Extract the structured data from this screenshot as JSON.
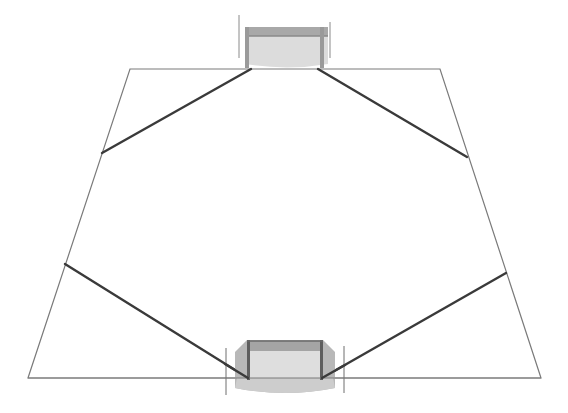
{
  "diagram": {
    "type": "football-pitch-perspective",
    "canvas": {
      "width": 568,
      "height": 413,
      "background": "#ffffff"
    },
    "colors": {
      "pitch_outline": "#7a7a7a",
      "run_lines": "#3a3a3a",
      "goal_frame": "#8c8c8c",
      "goal_frame_dark": "#9a9a9a",
      "goal_net": "#d9d9d9",
      "goal_side": "#b4b4b4",
      "goal_ground": "#cfcfcf",
      "post_lines": "#6e6e6e"
    },
    "pitch": {
      "corners": {
        "top_left": [
          130,
          69
        ],
        "top_right": [
          440,
          69
        ],
        "bottom_right": [
          541,
          378
        ],
        "bottom_left": [
          28,
          378
        ]
      }
    },
    "run_lines": [
      {
        "id": "top-left-run",
        "from": [
          102,
          153
        ],
        "to": [
          251,
          69
        ]
      },
      {
        "id": "top-right-run",
        "from": [
          318,
          69
        ],
        "to": [
          467,
          157
        ]
      },
      {
        "id": "bottom-left-run",
        "from": [
          65,
          264
        ],
        "to": [
          248,
          378
        ]
      },
      {
        "id": "bottom-right-run",
        "from": [
          322,
          378
        ],
        "to": [
          506,
          273
        ]
      }
    ],
    "goals": [
      {
        "id": "top-goal",
        "position": "top"
      },
      {
        "id": "bottom-goal",
        "position": "bottom"
      }
    ]
  }
}
